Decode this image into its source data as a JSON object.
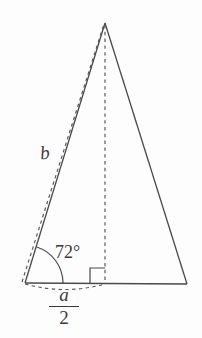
{
  "figure": {
    "name": "isosceles-triangle-with-altitude",
    "background_color": "#fdfdfd",
    "stroke_color": "#4a4a4a",
    "text_color": "#3a3a3a",
    "labels": {
      "side_b": "b",
      "base_angle": "72°",
      "half_base_numerator": "a",
      "half_base_denominator": "2"
    },
    "geometry": {
      "apex": {
        "x": 105,
        "y": 23
      },
      "bottom_left": {
        "x": 25,
        "y": 283
      },
      "bottom_right": {
        "x": 187,
        "y": 284
      },
      "altitude_foot": {
        "x": 105,
        "y": 283
      },
      "angle_arc_radius": 38,
      "right_angle_size": 15
    },
    "elements": {
      "base_line": "solid",
      "left_side": "solid",
      "right_side": "solid",
      "slant_side_b": "dashed",
      "altitude": "dashed",
      "half_base_arc": "dashed",
      "angle_arc": "solid",
      "right_angle_marker": "solid"
    }
  }
}
